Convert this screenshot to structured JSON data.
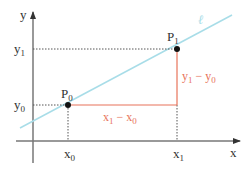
{
  "diagram": {
    "colors": {
      "axes": "#555555",
      "line_l": "#a8dde8",
      "difference": "#e8735a",
      "guide": "#555555",
      "point": "#111111"
    },
    "axes": {
      "x_label": "x",
      "y_label": "y"
    },
    "line": {
      "label": "ℓ"
    },
    "points": [
      {
        "name": "P",
        "sub": "0",
        "x_tick": "x",
        "x_tick_sub": "0",
        "y_tick": "y",
        "y_tick_sub": "0"
      },
      {
        "name": "P",
        "sub": "1",
        "x_tick": "x",
        "x_tick_sub": "1",
        "y_tick": "y",
        "y_tick_sub": "1"
      }
    ],
    "differences": {
      "horizontal": {
        "a": "x",
        "a_sub": "1",
        "op": " − ",
        "b": "x",
        "b_sub": "0"
      },
      "vertical": {
        "a": "y",
        "a_sub": "1",
        "op": " − ",
        "b": "y",
        "b_sub": "0"
      }
    }
  }
}
